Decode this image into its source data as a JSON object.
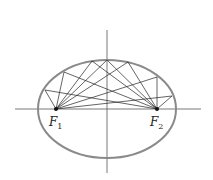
{
  "diagram": {
    "labels": {
      "focus1": {
        "main": "F",
        "sub": "1"
      },
      "focus2": {
        "main": "F",
        "sub": "2"
      }
    },
    "colors": {
      "ellipse": "#8a8a8a",
      "axes": "#555555",
      "rays": "#222222",
      "foci": "#111111"
    },
    "ellipse": {
      "cx": 107,
      "cy": 109,
      "rx": 69,
      "ry": 49
    },
    "foci": [
      {
        "x": 56,
        "y": 109
      },
      {
        "x": 157,
        "y": 109
      }
    ],
    "boundary_points": [
      {
        "x": 45,
        "y": 90
      },
      {
        "x": 64,
        "y": 72
      },
      {
        "x": 92,
        "y": 61
      },
      {
        "x": 107,
        "y": 60
      },
      {
        "x": 128,
        "y": 62
      },
      {
        "x": 157,
        "y": 77
      },
      {
        "x": 172,
        "y": 96
      }
    ]
  }
}
